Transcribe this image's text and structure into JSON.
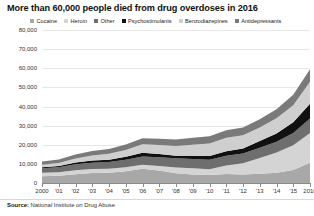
{
  "title": "More than 60,000 people died from drug overdoses in 2016",
  "source_prefix": "Source:",
  "source_text": "National Institute on Drug Abuse",
  "legend": {
    "items": [
      {
        "label": "Cocaine",
        "color": "#a8a8a8"
      },
      {
        "label": "Heroin",
        "color": "#d4d4d4"
      },
      {
        "label": "Other",
        "color": "#6e6e6e"
      },
      {
        "label": "Psychostimulants",
        "color": "#111111"
      },
      {
        "label": "Benzodiazepines",
        "color": "#cfcfcf"
      },
      {
        "label": "Antidepressants",
        "color": "#7a7a7a"
      }
    ]
  },
  "axes": {
    "y_ticks": [
      "0",
      "10,000",
      "20,000",
      "30,000",
      "40,000",
      "50,000",
      "60,000",
      "70,000",
      "80,000"
    ],
    "x_ticks": [
      "2000",
      "'01",
      "'02",
      "'03",
      "'04",
      "'05",
      "'06",
      "'07",
      "'08",
      "'09",
      "'10",
      "'11",
      "'12",
      "'13",
      "'14",
      "'15",
      "2016"
    ]
  },
  "chart_data": {
    "type": "area",
    "title": "More than 60,000 people died from drug overdoses in 2016",
    "xlabel": "",
    "ylabel": "",
    "ylim": [
      0,
      80000
    ],
    "ytick_values": [
      0,
      10000,
      20000,
      30000,
      40000,
      50000,
      60000,
      70000,
      80000
    ],
    "grid": true,
    "stacked": true,
    "legend_position": "top",
    "x": [
      2000,
      2001,
      2002,
      2003,
      2004,
      2005,
      2006,
      2007,
      2008,
      2009,
      2010,
      2011,
      2012,
      2013,
      2014,
      2015,
      2016
    ],
    "series": [
      {
        "name": "Cocaine",
        "color": "#a8a8a8",
        "values": [
          3500,
          3800,
          4600,
          5200,
          5400,
          6200,
          7400,
          6500,
          5100,
          4400,
          4200,
          4700,
          4400,
          4900,
          5400,
          6800,
          10600
        ]
      },
      {
        "name": "Heroin",
        "color": "#d4d4d4",
        "values": [
          1800,
          1800,
          2100,
          2100,
          2000,
          2000,
          2100,
          2400,
          3000,
          3300,
          3000,
          4400,
          5900,
          8200,
          10500,
          12900,
          15500
        ]
      },
      {
        "name": "Other",
        "color": "#6e6e6e",
        "values": [
          2400,
          2600,
          3100,
          3300,
          3600,
          3900,
          4400,
          4600,
          4800,
          4900,
          5000,
          5200,
          5100,
          5300,
          5700,
          6400,
          7600
        ]
      },
      {
        "name": "Psychostimulants",
        "color": "#111111",
        "values": [
          600,
          700,
          900,
          1100,
          1200,
          1600,
          1900,
          1600,
          1300,
          1600,
          1900,
          2300,
          2600,
          3600,
          4300,
          5700,
          7700
        ]
      },
      {
        "name": "Benzodiazepines",
        "color": "#cfcfcf",
        "values": [
          1300,
          1600,
          2100,
          2700,
          3100,
          3600,
          4400,
          4800,
          5100,
          5800,
          6500,
          7000,
          7000,
          7000,
          7900,
          8800,
          11500
        ]
      },
      {
        "name": "Antidepressants",
        "color": "#7a7a7a",
        "values": [
          1600,
          1800,
          2100,
          2300,
          2500,
          2800,
          3200,
          3300,
          3400,
          3600,
          3800,
          4000,
          4000,
          4300,
          4800,
          5500,
          6600
        ]
      }
    ],
    "totals": [
      11200,
      12300,
      14900,
      16700,
      17800,
      20100,
      23400,
      23200,
      22700,
      23600,
      24400,
      27600,
      29000,
      33300,
      38600,
      46100,
      59500
    ],
    "annotation_total_2016": "More than 60,000"
  }
}
